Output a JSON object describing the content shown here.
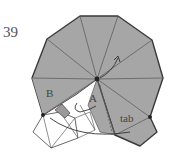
{
  "diagram": {
    "step_number": "39",
    "labels": {
      "a": "A",
      "b": "B",
      "tab": "tab"
    },
    "colors": {
      "paper_colored": "#a6a6a6",
      "paper_white": "#ffffff",
      "outline": "#444444",
      "crease": "#555555",
      "dot": "#222222"
    },
    "icons": [
      "fold-arrow-icon",
      "center-point-icon",
      "reference-point-icon"
    ]
  }
}
